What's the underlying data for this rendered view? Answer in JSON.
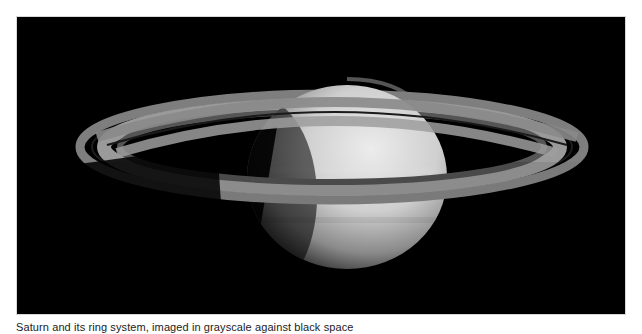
{
  "figure": {
    "background_color": "#000000",
    "frame_border_color": "#d8d8d8",
    "caption": "Saturn and its ring system, imaged in grayscale against black space"
  },
  "colors": {
    "planet_light": "#e6e6e6",
    "planet_mid": "#a8a8a8",
    "planet_dark": "#2a2a2a",
    "ring_outer": "#8a8a8a",
    "ring_mid": "#6c6c6c",
    "ring_inner": "#9a9a9a",
    "cassini_gap": "#1a1a1a"
  }
}
